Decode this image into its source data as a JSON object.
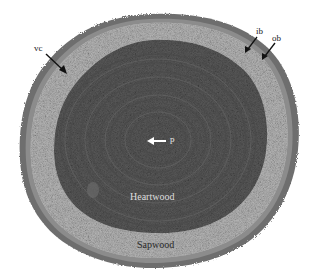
{
  "image": {
    "subject": "Cross-section of a tree trunk",
    "colors": {
      "background": "#ffffff",
      "outer_bark": "#6e6e6e",
      "inner_bark": "#8c8c8c",
      "sapwood": "#b8b8b8",
      "heartwood": "#5a5a5a",
      "heartwood_rings": "#4a4a4a",
      "pith": "#3e3e3e"
    }
  },
  "labels": {
    "vc": "vc",
    "ib": "ib",
    "ob": "ob",
    "p": "p",
    "heartwood": "Heartwood",
    "sapwood": "Sapwood"
  }
}
